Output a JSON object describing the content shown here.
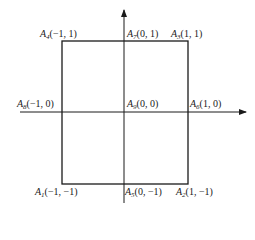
{
  "diagram": {
    "type": "coordinate-square",
    "colors": {
      "line": "#1a1a1a",
      "background": "#ffffff"
    },
    "points": [
      {
        "name": "A",
        "index": "1",
        "coords": "(−1, −1)"
      },
      {
        "name": "A",
        "index": "2",
        "coords": "(1, −1)"
      },
      {
        "name": "A",
        "index": "3",
        "coords": "(1, 1)"
      },
      {
        "name": "A",
        "index": "4",
        "coords": "(−1, 1)"
      },
      {
        "name": "A",
        "index": "5",
        "coords": "(0, −1)"
      },
      {
        "name": "A",
        "index": "6",
        "coords": "(1, 0)"
      },
      {
        "name": "A",
        "index": "7",
        "coords": "(0, 1)"
      },
      {
        "name": "A",
        "index": "8",
        "coords": "(−1, 0)"
      },
      {
        "name": "A",
        "index": "9",
        "coords": "(0, 0)"
      }
    ]
  }
}
